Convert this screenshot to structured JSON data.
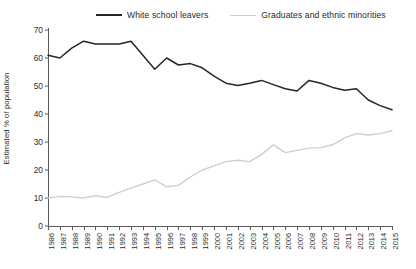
{
  "legend": {
    "entries": [
      {
        "label": "White school leavers",
        "color": "#262626",
        "style": "dark"
      },
      {
        "label": "Graduates and ethnic minorities",
        "color": "#cfcfcf",
        "style": "light"
      }
    ]
  },
  "axes": {
    "ylabel": "Estimated % of population",
    "yticks": [
      "0",
      "10",
      "20",
      "30",
      "40",
      "50",
      "60",
      "70"
    ],
    "xlabel": ""
  },
  "chart_data": {
    "type": "line",
    "title": "",
    "xlabel": "",
    "ylabel": "Estimated % of population",
    "ylim": [
      0,
      70
    ],
    "yticks": [
      0,
      10,
      20,
      30,
      40,
      50,
      60,
      70
    ],
    "grid": false,
    "legend_position": "top",
    "categories": [
      "1986",
      "1987",
      "1988",
      "1989",
      "1990",
      "1991",
      "1992",
      "1993",
      "1994",
      "1995",
      "1996",
      "1997",
      "1998",
      "1999",
      "2000",
      "2001",
      "2002",
      "2003",
      "2004",
      "2005",
      "2006",
      "2007",
      "2008",
      "2009",
      "2010",
      "2011",
      "2012",
      "2013",
      "2014",
      "2015"
    ],
    "series": [
      {
        "name": "White school leavers",
        "color": "#262626",
        "values": [
          61,
          60,
          63.5,
          66,
          65,
          65,
          65,
          66,
          61,
          56,
          60,
          57.5,
          58,
          56.5,
          53.5,
          51,
          50.2,
          51,
          52,
          50.5,
          49,
          48.2,
          52,
          51,
          49.5,
          48.5,
          49,
          45,
          43,
          41.5
        ]
      },
      {
        "name": "Graduates and ethnic minorities",
        "color": "#cfcfcf",
        "values": [
          10,
          10.6,
          10.4,
          10,
          10.8,
          10.2,
          12,
          13.5,
          15,
          16.5,
          14,
          14.5,
          17.5,
          20,
          21.5,
          23,
          23.5,
          23,
          25.5,
          29,
          26.2,
          27,
          27.8,
          28,
          29,
          31.5,
          33,
          32.5,
          33,
          34
        ]
      }
    ]
  }
}
